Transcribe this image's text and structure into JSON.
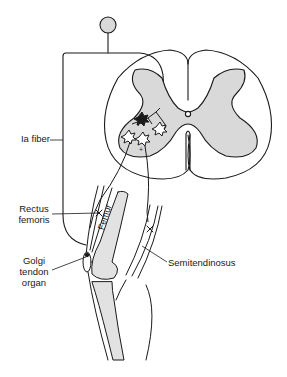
{
  "diagram": {
    "labels": {
      "ia_fiber": "Ia fiber",
      "rectus_femoris_line1": "Rectus",
      "rectus_femoris_line2": "femoris",
      "golgi_line1": "Golgi",
      "golgi_line2": "tendon",
      "golgi_line3": "organ",
      "semitendinosus": "Semitendinosus",
      "femur": "Femur"
    },
    "neurons": {
      "inhibitory_interneuron": "black star",
      "motor_neurons": [
        "white star (left)",
        "white star (middle, +)",
        "white star (right)"
      ]
    },
    "colors": {
      "line": "#1a1a1a",
      "gray_matter": "#d9d9d9",
      "background": "#ffffff"
    }
  }
}
